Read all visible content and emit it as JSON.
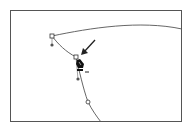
{
  "figure": {
    "frame": {
      "x": 10,
      "y": 10,
      "width": 172,
      "height": 112,
      "stroke": "#555555"
    },
    "path_color": "#444444",
    "anchors": [
      {
        "id": "anchor-top-left",
        "x": 52,
        "y": 36,
        "shape": "square"
      },
      {
        "id": "anchor-selected",
        "x": 76,
        "y": 57,
        "shape": "square"
      },
      {
        "id": "anchor-lower",
        "x": 88,
        "y": 102,
        "shape": "circle"
      }
    ],
    "handles": [
      {
        "id": "handle-top-left",
        "x": 52,
        "y": 45
      },
      {
        "id": "handle-lower",
        "x": 78,
        "y": 79
      }
    ],
    "cursor": {
      "tool": "pen-delete-anchor",
      "x": 78,
      "y": 60,
      "modifier": "−"
    },
    "arrow": {
      "from": [
        95,
        40
      ],
      "to": [
        82,
        54
      ]
    }
  }
}
